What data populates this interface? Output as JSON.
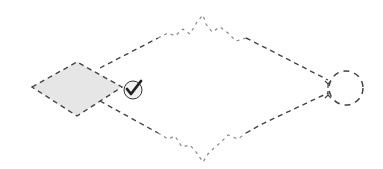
{
  "diagram": {
    "type": "flow-gateway-diagram",
    "colors": {
      "stroke": "#444444",
      "stroke_light": "#888888",
      "diamond_fill": "#e6e6e6",
      "check_fill": "#222222",
      "background": "#ffffff"
    },
    "nodes": [
      {
        "id": "gateway",
        "shape": "diamond",
        "fill": "shaded",
        "border": "dashed"
      },
      {
        "id": "check",
        "shape": "circle",
        "icon": "checkmark-icon"
      },
      {
        "id": "end",
        "shape": "circle",
        "border": "dashed"
      }
    ],
    "edges": [
      {
        "from": "gateway",
        "to": "end",
        "path": "upper",
        "style": "dashed-with-zigzag"
      },
      {
        "from": "gateway",
        "to": "end",
        "path": "lower",
        "style": "dashed-with-zigzag"
      }
    ]
  }
}
